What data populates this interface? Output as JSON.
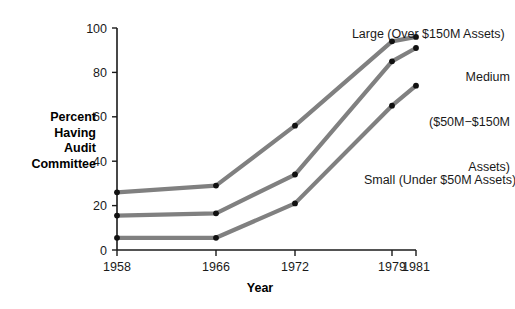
{
  "chart_data": {
    "type": "line",
    "title": "",
    "xlabel": "Year",
    "ylabel": "Percent Having Audit Committee",
    "ylabel_lines": [
      "Percent",
      "Having",
      "Audit",
      "Committee"
    ],
    "x": [
      1958,
      1966,
      1972,
      1979,
      1981
    ],
    "xtick_labels": [
      "1958",
      "1966",
      "1972",
      "1979",
      "1981"
    ],
    "ytick_labels": [
      "0",
      "20",
      "40",
      "60",
      "80",
      "100"
    ],
    "ytick_values": [
      0,
      20,
      40,
      60,
      80,
      100
    ],
    "ylim": [
      0,
      100
    ],
    "xlim": [
      1958,
      1981
    ],
    "grid": false,
    "legend_position": "inline-annotations",
    "marker": "filled-circle",
    "line_color": "#808080",
    "marker_color": "#111111",
    "axis_color": "#1a1a1a",
    "series": [
      {
        "name": "Large (Over $150M Assets)",
        "label_lines": [
          "Large (Over $150M Assets)"
        ],
        "values": [
          26,
          29,
          56,
          94,
          96
        ]
      },
      {
        "name": "Medium ($50M−$150M Assets)",
        "label_lines": [
          "Medium",
          "($50M−$150M",
          "Assets)"
        ],
        "values": [
          15.5,
          16.5,
          34,
          85,
          91
        ]
      },
      {
        "name": "Small (Under $50M Assets)",
        "label_lines": [
          "Small (Under $50M Assets)"
        ],
        "values": [
          5.5,
          5.5,
          21,
          65,
          74
        ]
      }
    ]
  },
  "annotations": {
    "large_label": "Large (Over $150M Assets)",
    "medium_label_line1": "Medium",
    "medium_label_line2": "($50M−$150M",
    "medium_label_line3": "Assets)",
    "small_label": "Small (Under $50M Assets)"
  },
  "axes": {
    "y_title_line1": "Percent",
    "y_title_line2": "Having",
    "y_title_line3": "Audit",
    "y_title_line4": "Committee",
    "x_title": "Year"
  }
}
